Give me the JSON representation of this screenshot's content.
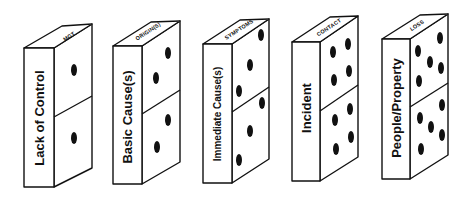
{
  "diagram": {
    "colors": {
      "ink": "#111111",
      "paper": "#ffffff"
    },
    "dominoes": [
      {
        "front_label": "Lack of Control",
        "top_label": "MGT",
        "pips_top": 1,
        "pips_bottom": 1
      },
      {
        "front_label": "Basic Cause(s)",
        "top_label": "ORIGIN(S)",
        "pips_top": 2,
        "pips_bottom": 2
      },
      {
        "front_label": "Immediate Cause(s)",
        "top_label": "SYMPTOMS",
        "pips_top": 3,
        "pips_bottom": 3
      },
      {
        "front_label": "Incident",
        "top_label": "CONTACT",
        "pips_top": 4,
        "pips_bottom": 4
      },
      {
        "front_label": "People/Property",
        "top_label": "LOSS",
        "pips_top": 5,
        "pips_bottom": 5
      }
    ]
  }
}
